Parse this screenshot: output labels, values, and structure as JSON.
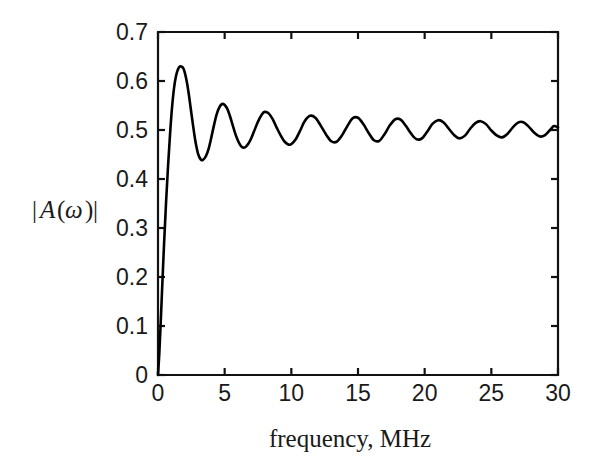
{
  "figure": {
    "background_color": "#ffffff",
    "curve_color": "#000000",
    "axis_color": "#111111"
  },
  "chart_data": {
    "type": "line",
    "title": "",
    "xlabel": "frequency, MHz",
    "ylabel": "|A(ω)|",
    "ylabel_parts": {
      "bar_left": "|",
      "symbol": "A",
      "paren_open": "(",
      "omega": "ω",
      "paren_close": ")",
      "bar_right": "|"
    },
    "xlim": [
      0,
      30
    ],
    "ylim": [
      0,
      0.7
    ],
    "xticks": [
      0,
      5,
      10,
      15,
      20,
      25,
      30
    ],
    "xtick_labels": [
      "0",
      "5",
      "10",
      "15",
      "20",
      "25",
      "30"
    ],
    "yticks": [
      0,
      0.1,
      0.2,
      0.3,
      0.4,
      0.5,
      0.6,
      0.7
    ],
    "ytick_labels": [
      "0",
      "0.1",
      "0.2",
      "0.3",
      "0.4",
      "0.5",
      "0.6",
      "0.7"
    ],
    "grid": false,
    "legend": null,
    "series": [
      {
        "name": "|A(ω)|",
        "color": "#000000",
        "asymptote": 0.5,
        "oscillation_period_mhz": 3.0,
        "description": "Damped oscillating magnitude response rising sharply from 0 and settling toward 0.5",
        "x": [
          0.0,
          0.1,
          0.2,
          0.3,
          0.45,
          0.6,
          0.75,
          0.9,
          1.05,
          1.2,
          1.35,
          1.5,
          1.65,
          1.8,
          1.9,
          2.0,
          2.15,
          2.3,
          2.45,
          2.6,
          2.8,
          3.0,
          3.2,
          3.37,
          3.6,
          3.8,
          4.0,
          4.2,
          4.4,
          4.6,
          4.8,
          5.0,
          5.2,
          5.4,
          5.6,
          5.8,
          6.0,
          6.2,
          6.4,
          6.6,
          6.9,
          7.2,
          7.5,
          7.8,
          8.0,
          8.3,
          8.6,
          8.9,
          9.2,
          9.5,
          9.9,
          10.3,
          10.7,
          11.0,
          11.4,
          11.8,
          12.2,
          12.6,
          13.0,
          13.4,
          13.8,
          14.2,
          14.6,
          15.0,
          15.4,
          15.8,
          16.2,
          16.6,
          17.0,
          17.4,
          17.8,
          18.2,
          18.6,
          19.0,
          19.4,
          19.8,
          20.2,
          20.6,
          21.0,
          21.4,
          21.8,
          22.2,
          22.6,
          23.0,
          23.4,
          23.8,
          24.2,
          24.6,
          25.0,
          25.4,
          25.8,
          26.2,
          26.6,
          27.0,
          27.4,
          27.8,
          28.2,
          28.6,
          29.0,
          29.4,
          29.7,
          30.0
        ],
        "y": [
          0.0,
          0.045,
          0.105,
          0.17,
          0.265,
          0.35,
          0.425,
          0.49,
          0.545,
          0.585,
          0.61,
          0.624,
          0.63,
          0.629,
          0.626,
          0.618,
          0.6,
          0.575,
          0.545,
          0.515,
          0.478,
          0.452,
          0.44,
          0.439,
          0.447,
          0.462,
          0.485,
          0.51,
          0.532,
          0.546,
          0.553,
          0.551,
          0.543,
          0.528,
          0.51,
          0.492,
          0.478,
          0.468,
          0.464,
          0.466,
          0.478,
          0.497,
          0.517,
          0.532,
          0.537,
          0.534,
          0.522,
          0.505,
          0.489,
          0.476,
          0.47,
          0.48,
          0.501,
          0.518,
          0.529,
          0.525,
          0.509,
          0.491,
          0.477,
          0.476,
          0.489,
          0.508,
          0.524,
          0.525,
          0.512,
          0.494,
          0.479,
          0.478,
          0.492,
          0.51,
          0.522,
          0.521,
          0.508,
          0.492,
          0.481,
          0.483,
          0.497,
          0.513,
          0.52,
          0.516,
          0.503,
          0.49,
          0.483,
          0.488,
          0.502,
          0.514,
          0.518,
          0.512,
          0.499,
          0.489,
          0.485,
          0.492,
          0.505,
          0.515,
          0.516,
          0.507,
          0.495,
          0.487,
          0.489,
          0.5,
          0.508,
          0.505
        ]
      }
    ]
  }
}
